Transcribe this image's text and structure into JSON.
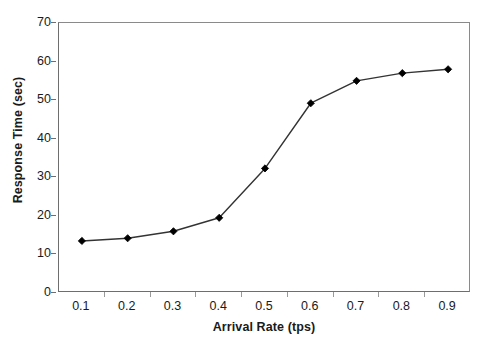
{
  "chart_data": {
    "type": "line",
    "title": "",
    "subtitle": "",
    "xlabel": "Arrival Rate (tps)",
    "ylabel": "Response Time (sec)",
    "x": [
      0.1,
      0.2,
      0.3,
      0.4,
      0.5,
      0.6,
      0.7,
      0.8,
      0.9
    ],
    "categories": [
      "0.1",
      "0.2",
      "0.3",
      "0.4",
      "0.5",
      "0.6",
      "0.7",
      "0.8",
      "0.9"
    ],
    "values": [
      13.5,
      14.2,
      16.0,
      19.5,
      32.3,
      49.2,
      55.0,
      57.0,
      58.0
    ],
    "series": [
      {
        "name": "Response Time",
        "values": [
          13.5,
          14.2,
          16.0,
          19.5,
          32.3,
          49.2,
          55.0,
          57.0,
          58.0
        ],
        "marker": "diamond",
        "marker_color": "#000000",
        "line_color": "#333333"
      }
    ],
    "xlim": [
      0.05,
      0.95
    ],
    "ylim": [
      0,
      70
    ],
    "yticks": [
      0,
      10,
      20,
      30,
      40,
      50,
      60,
      70
    ],
    "ytick_labels": [
      "0",
      "10",
      "20",
      "30",
      "40",
      "50",
      "60",
      "70"
    ],
    "xticks": [
      0.1,
      0.2,
      0.3,
      0.4,
      0.5,
      0.6,
      0.7,
      0.8,
      0.9
    ],
    "xtick_labels": [
      "0.1",
      "0.2",
      "0.3",
      "0.4",
      "0.5",
      "0.6",
      "0.7",
      "0.8",
      "0.9"
    ],
    "grid": false,
    "legend": false,
    "legend_position": "none",
    "annotations": []
  },
  "colors": {
    "background": "#ffffff",
    "axis": "#6e6e6e",
    "line": "#333333",
    "marker": "#000000",
    "text": "#1a1a1a"
  }
}
